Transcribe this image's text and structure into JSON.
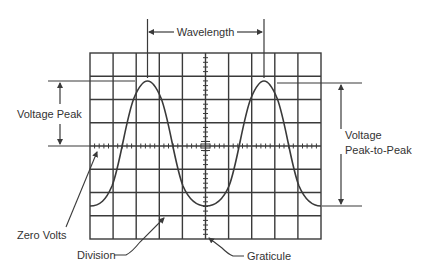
{
  "colors": {
    "line": "#3a3a3a",
    "text": "#333333",
    "background": "#ffffff"
  },
  "graticule": {
    "columns": 10,
    "rows": 8,
    "minor_ticks_per_division": 5
  },
  "waveform": {
    "shape": "sine",
    "cycles_visible": 2
  },
  "labels": {
    "wavelength": "Wavelength",
    "voltage_peak": "Voltage Peak",
    "voltage_pp_line1": "Voltage",
    "voltage_pp_line2": "Peak-to-Peak",
    "zero_volts": "Zero Volts",
    "division": "Division",
    "graticule": "Graticule"
  }
}
